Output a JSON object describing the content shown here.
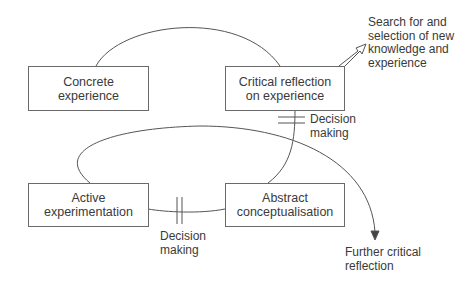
{
  "diagram": {
    "nodes": [
      {
        "id": "concrete",
        "label": "Concrete\nexperience"
      },
      {
        "id": "critical",
        "label": "Critical reflection\non experience"
      },
      {
        "id": "active",
        "label": "Active\nexperimentation"
      },
      {
        "id": "abstract",
        "label": "Abstract\nconceptualisation"
      }
    ],
    "annotations": {
      "search": "Search for and\nselection of new\nknowledge and\nexperience",
      "decision_upper": "Decision\nmaking",
      "decision_lower": "Decision\nmaking",
      "further": "Further critical\nreflection"
    },
    "colors": {
      "line": "#555555",
      "text": "#3a3a3a"
    }
  }
}
